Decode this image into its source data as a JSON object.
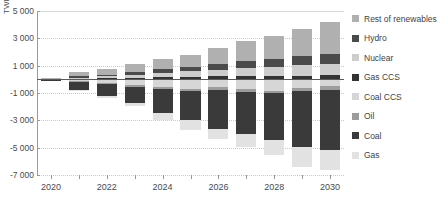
{
  "chart_data": {
    "type": "bar",
    "title": "",
    "xlabel": "",
    "ylabel": "TWh",
    "ylim": [
      -7000,
      5000
    ],
    "ytick_values": [
      5000,
      3000,
      1000,
      -1000,
      -3000,
      -5000,
      -7000
    ],
    "ytick_labels": [
      "5 000",
      "3 000",
      "1 000",
      "-1 000",
      "-3 000",
      "-5 000",
      "-7 000"
    ],
    "grid": true,
    "stacked": true,
    "legend_position": "right",
    "categories": [
      2020,
      2021,
      2022,
      2023,
      2024,
      2025,
      2026,
      2027,
      2028,
      2029,
      2030
    ],
    "xtick_labels": [
      "2020",
      "2022",
      "2024",
      "2026",
      "2028",
      "2030"
    ],
    "xtick_categories": [
      2020,
      2022,
      2024,
      2026,
      2028,
      2030
    ],
    "series": [
      {
        "name": "Rest of renewables",
        "color": "#b0b0b0",
        "sign": "positive",
        "values": [
          60,
          300,
          430,
          620,
          780,
          900,
          1180,
          1500,
          1720,
          2020,
          2300
        ]
      },
      {
        "name": "Hydro",
        "color": "#4a4a4a",
        "sign": "positive",
        "values": [
          20,
          90,
          130,
          190,
          250,
          330,
          420,
          500,
          570,
          650,
          720
        ]
      },
      {
        "name": "Nuclear",
        "color": "#cdcdcd",
        "sign": "positive",
        "values": [
          10,
          80,
          140,
          230,
          320,
          400,
          490,
          600,
          660,
          760,
          860
        ]
      },
      {
        "name": "Gas CCS",
        "color": "#333333",
        "sign": "positive",
        "values": [
          5,
          40,
          80,
          110,
          150,
          180,
          210,
          230,
          250,
          270,
          290
        ]
      },
      {
        "name": "Coal CCS",
        "color": "#d6d6d6",
        "sign": "negative",
        "values": [
          -10,
          -130,
          -260,
          -420,
          -560,
          -700,
          -560,
          -700,
          -820,
          -640,
          -520
        ]
      },
      {
        "name": "Oil",
        "color": "#9c9c9c",
        "sign": "negative",
        "values": [
          -20,
          -60,
          -90,
          -120,
          -150,
          -170,
          -190,
          -200,
          -210,
          -220,
          -230
        ]
      },
      {
        "name": "Coal",
        "color": "#3a3a3a",
        "sign": "negative",
        "values": [
          -40,
          -580,
          -900,
          -1180,
          -1740,
          -2120,
          -2850,
          -3080,
          -3420,
          -4090,
          -4450
        ]
      },
      {
        "name": "Gas",
        "color": "#e2e2e2",
        "sign": "negative",
        "values": [
          -5,
          -60,
          -120,
          -260,
          -500,
          -740,
          -800,
          -1000,
          -1100,
          -1450,
          -1400
        ]
      }
    ]
  },
  "legend": {
    "items": [
      {
        "label": "Rest of renewables",
        "color": "#b0b0b0"
      },
      {
        "label": "Hydro",
        "color": "#4a4a4a"
      },
      {
        "label": "Nuclear",
        "color": "#cdcdcd"
      },
      {
        "label": "Gas CCS",
        "color": "#333333"
      },
      {
        "label": "Coal CCS",
        "color": "#d6d6d6"
      },
      {
        "label": "Oil",
        "color": "#9c9c9c"
      },
      {
        "label": "Coal",
        "color": "#3a3a3a"
      },
      {
        "label": "Gas",
        "color": "#e2e2e2"
      }
    ]
  },
  "axis": {
    "y_title": "TWh"
  }
}
